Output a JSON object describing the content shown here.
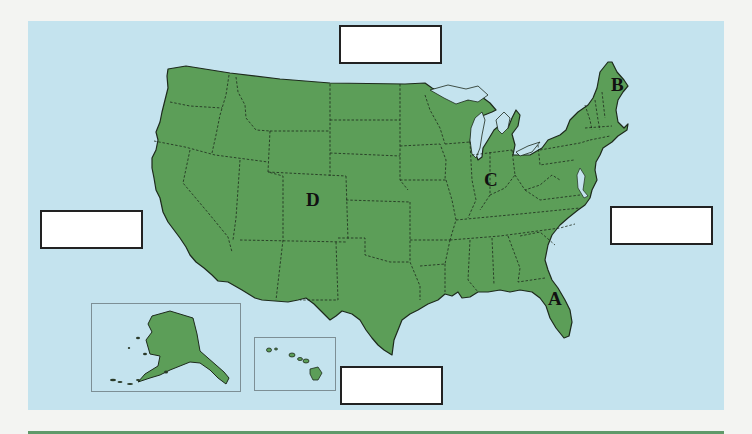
{
  "map": {
    "title": "United States map worksheet",
    "land_color": "#5c9e58",
    "water_color": "#c4e3ee",
    "border_color": "#1d2a1c",
    "labels": [
      {
        "id": "A",
        "text": "A",
        "region": "Florida/Georgia coast"
      },
      {
        "id": "B",
        "text": "B",
        "region": "Maine"
      },
      {
        "id": "C",
        "text": "C",
        "region": "Indiana"
      },
      {
        "id": "D",
        "text": "D",
        "region": "Colorado"
      }
    ],
    "insets": [
      {
        "name": "Alaska"
      },
      {
        "name": "Hawaii"
      }
    ]
  },
  "answer_boxes": {
    "top": "",
    "left": "",
    "right": "",
    "bottom": ""
  }
}
